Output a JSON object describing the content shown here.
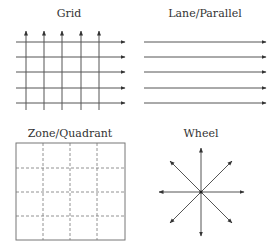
{
  "diagrams": {
    "grid": {
      "title": "Grid"
    },
    "lane": {
      "title": "Lane/Parallel"
    },
    "zone": {
      "title": "Zone/Quadrant"
    },
    "wheel": {
      "title": "Wheel"
    }
  },
  "colors": {
    "line": "#555555",
    "dashed": "#777777",
    "text": "#333333",
    "background": "#ffffff"
  }
}
